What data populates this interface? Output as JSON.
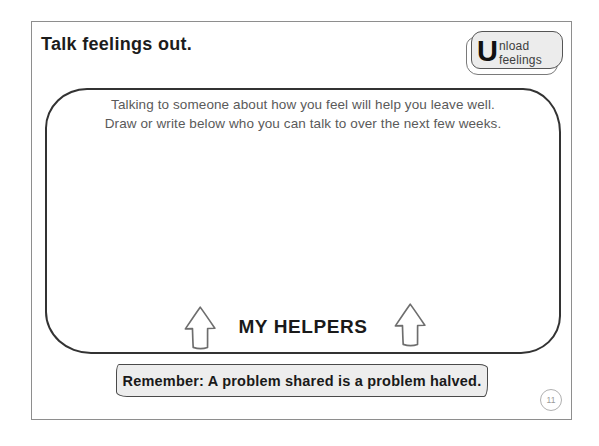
{
  "page": {
    "title": "Talk feelings out.",
    "number": "11"
  },
  "badge": {
    "initial": "U",
    "label": "nload feelings"
  },
  "box": {
    "instruction_line1": "Talking to someone about how you feel will help you leave well.",
    "instruction_line2": "Draw or write below who you can talk to over the next few weeks.",
    "caption": "MY HELPERS"
  },
  "footer": {
    "reminder": "Remember: A problem shared is a problem halved."
  },
  "colors": {
    "page_border": "#8e8e8e",
    "box_border": "#333333",
    "badge_fill": "#ececec",
    "banner_fill": "#ededed",
    "instruction_text": "#5a5a5a",
    "page_number_gray": "#9a9a9a"
  }
}
